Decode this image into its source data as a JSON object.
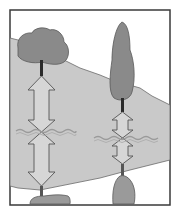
{
  "diagram": {
    "colors": {
      "background": "#ffffff",
      "border": "#3a3a3a",
      "land": "#c9c9c9",
      "tree": "#8a8a8a",
      "trunk": "#2a2a2a",
      "rock": "#9a9a9a",
      "arrow_fill": "#d6d6d6",
      "arrow_stroke": "#555555",
      "wave": "#9a9a9a"
    },
    "elements": {
      "left_tree": "broad-leaf-tree",
      "right_tree": "cypress-tree",
      "left_arrows": "double-arrows-long",
      "right_arrows": "double-arrows-short",
      "water_line": "wavy-line"
    }
  }
}
